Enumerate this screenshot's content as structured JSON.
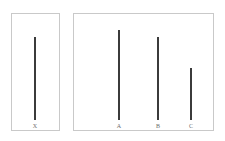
{
  "figure": {
    "name": "line-judgment-task",
    "background_color": "#ffffff",
    "panel_border_color": "#c9c9c9",
    "line_color": "#3b3b3b",
    "label_color": "#6d6d6d"
  },
  "reference_panel": {
    "name": "reference-panel",
    "lines": [
      {
        "label": "X",
        "length_px": 83,
        "left_px": 23
      }
    ]
  },
  "comparison_panel": {
    "name": "comparison-panel",
    "lines": [
      {
        "label": "A",
        "length_px": 90,
        "left_px": 45
      },
      {
        "label": "B",
        "length_px": 83,
        "left_px": 84
      },
      {
        "label": "C",
        "length_px": 52,
        "left_px": 117
      }
    ]
  },
  "chart_data": {
    "type": "bar",
    "title": "",
    "subtitle": "",
    "xlabel": "",
    "ylabel": "",
    "orientation": "vertical",
    "grid": false,
    "legend": null,
    "categories": [
      "X",
      "A",
      "B",
      "C"
    ],
    "values": [
      83,
      90,
      83,
      52
    ],
    "ylim": [
      0,
      101
    ],
    "groups": [
      {
        "name": "reference",
        "categories": [
          "X"
        ],
        "values": [
          83
        ]
      },
      {
        "name": "comparison",
        "categories": [
          "A",
          "B",
          "C"
        ],
        "values": [
          90,
          83,
          52
        ]
      }
    ],
    "annotations": []
  }
}
